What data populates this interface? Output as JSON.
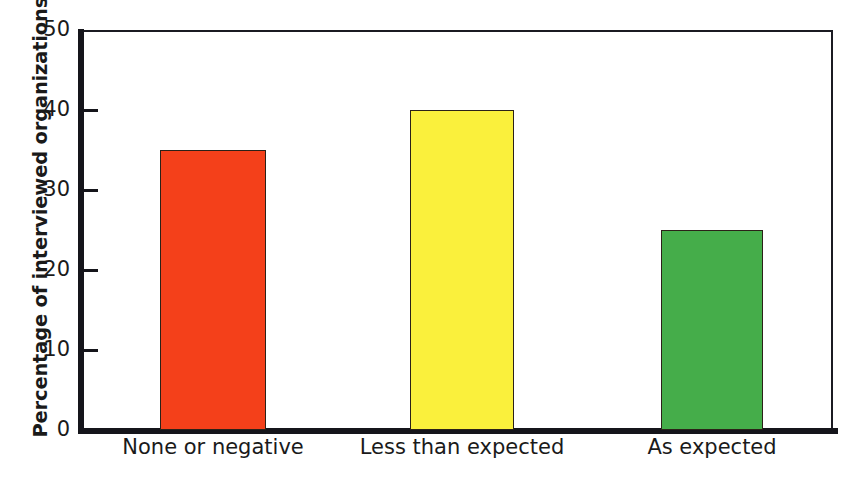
{
  "chart_data": {
    "type": "bar",
    "title": "",
    "xlabel": "",
    "ylabel": "Percentage of interviewed organizations",
    "categories": [
      "None or negative",
      "Less than expected",
      "As expected"
    ],
    "values": [
      35,
      40,
      25
    ],
    "ylim": [
      0,
      50
    ],
    "yticks": [
      "0",
      "10",
      "20",
      "30",
      "40",
      "50"
    ],
    "ytick_values": [
      0,
      10,
      20,
      30,
      40,
      50
    ],
    "grid": false,
    "legend": null,
    "bar_colors": [
      "#f4401a",
      "#faf03c",
      "#45ad4a"
    ],
    "bar_edge_color": "#2b2118",
    "axis_color": "#15151b",
    "background": "#ffffff"
  },
  "axis": {
    "y_title": "Percentage of interviewed organizations"
  }
}
